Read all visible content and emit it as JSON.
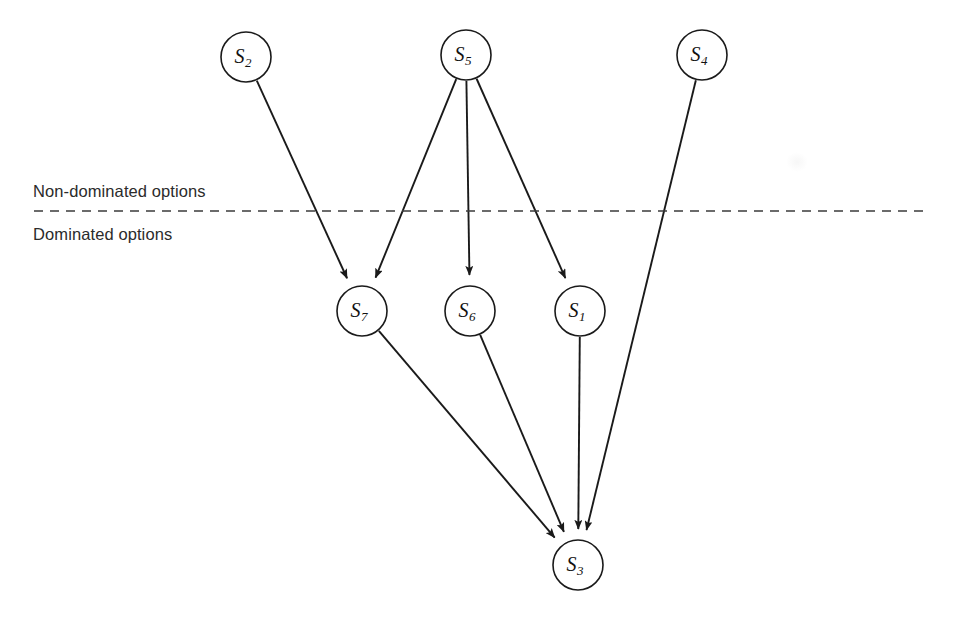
{
  "diagram": {
    "background_color": "#ffffff",
    "line_color": "#1a1a1a",
    "divider": {
      "label_above": "Non-dominated options",
      "label_below": "Dominated options",
      "style": "dashed",
      "y": 211,
      "x_start": 34,
      "x_end": 928,
      "label_above_x": 33,
      "label_above_y": 197,
      "label_below_x": 33,
      "label_below_y": 240
    },
    "nodes": [
      {
        "id": "S2",
        "base": "S",
        "sub": "2",
        "cx": 246,
        "cy": 57,
        "r": 25,
        "region": "non-dominated"
      },
      {
        "id": "S5",
        "base": "S",
        "sub": "5",
        "cx": 466,
        "cy": 55,
        "r": 25,
        "region": "non-dominated"
      },
      {
        "id": "S4",
        "base": "S",
        "sub": "4",
        "cx": 702,
        "cy": 55,
        "r": 25,
        "region": "non-dominated"
      },
      {
        "id": "S7",
        "base": "S",
        "sub": "7",
        "cx": 362,
        "cy": 311,
        "r": 25,
        "region": "dominated"
      },
      {
        "id": "S6",
        "base": "S",
        "sub": "6",
        "cx": 470,
        "cy": 311,
        "r": 25,
        "region": "dominated"
      },
      {
        "id": "S1",
        "base": "S",
        "sub": "1",
        "cx": 580,
        "cy": 311,
        "r": 25,
        "region": "dominated"
      },
      {
        "id": "S3",
        "base": "S",
        "sub": "3",
        "cx": 578,
        "cy": 565,
        "r": 25,
        "region": "dominated"
      }
    ],
    "edges": [
      {
        "from": "S2",
        "to": "S7",
        "directed": true
      },
      {
        "from": "S5",
        "to": "S7",
        "directed": true
      },
      {
        "from": "S5",
        "to": "S6",
        "directed": true
      },
      {
        "from": "S5",
        "to": "S1",
        "directed": true
      },
      {
        "from": "S4",
        "to": "S3",
        "directed": true
      },
      {
        "from": "S7",
        "to": "S3",
        "directed": true
      },
      {
        "from": "S6",
        "to": "S3",
        "directed": true
      },
      {
        "from": "S1",
        "to": "S3",
        "directed": true
      }
    ]
  }
}
